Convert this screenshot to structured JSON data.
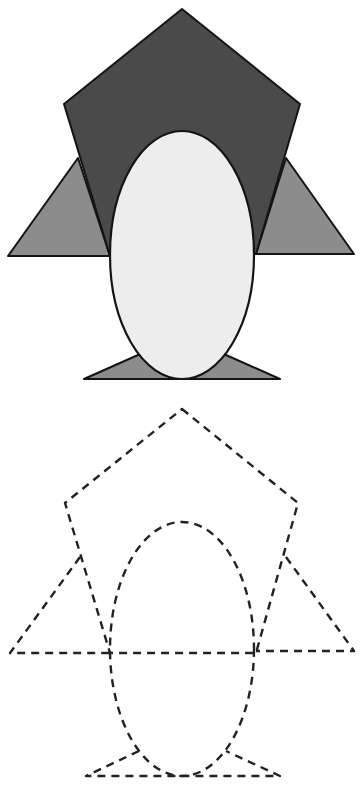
{
  "figure": {
    "colors": {
      "body": "#4a4a4a",
      "wing": "#8c8c8c",
      "belly": "#ededed",
      "feet": "#8c8c8c",
      "stroke": "#141414",
      "dash": "#222222",
      "background": "#ffffff"
    },
    "filled_penguin": {
      "shapes": [
        "pentagon-body",
        "left-triangle-wing",
        "right-triangle-wing",
        "oval-belly",
        "triangle-feet"
      ]
    },
    "tracing_penguin": {
      "style": "dashed outline",
      "shapes": [
        "pentagon-body",
        "left-triangle-wing",
        "right-triangle-wing",
        "oval-belly",
        "triangle-feet"
      ]
    }
  }
}
